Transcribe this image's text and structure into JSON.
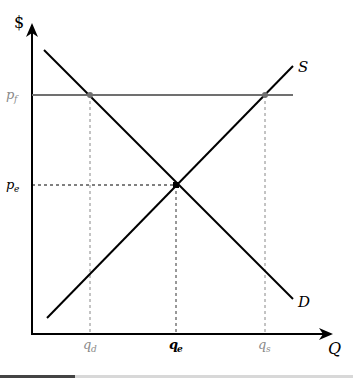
{
  "diagram": {
    "y_axis_label": "$",
    "x_axis_label": "Q",
    "supply_label": "S",
    "demand_label": "D",
    "price_floor_label": "p_f",
    "price_floor_label_main": "p",
    "price_floor_label_sub": "f",
    "equilibrium_price_label_main": "p",
    "equilibrium_price_label_sub": "e",
    "q_demanded_main": "q",
    "q_demanded_sub": "d",
    "q_equilibrium_main": "q",
    "q_equilibrium_sub": "e",
    "q_supplied_main": "q",
    "q_supplied_sub": "s",
    "colors": {
      "axis": "#000000",
      "curves": "#000000",
      "price_floor": "#707070",
      "gray_labels": "#8a8a8a",
      "guides": "#000000"
    }
  }
}
